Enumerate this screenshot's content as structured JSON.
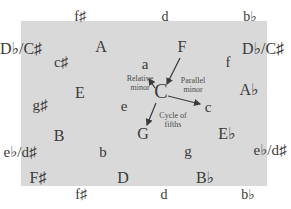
{
  "diagram": {
    "colors": {
      "panel": "#d9d9d9",
      "text": "#3a3a3a",
      "arrow": "#3a3a3a"
    },
    "keys": {
      "top_f_sharp": "f♯",
      "top_d": "d",
      "top_b_flat": "b♭",
      "left_db_cs_top": "D♭/C♯",
      "right_db_cs_top": "D♭/C♯",
      "A": "A",
      "c_sharp": "c♯",
      "a": "a",
      "F": "F",
      "f": "f",
      "C": "C",
      "E": "E",
      "A_flat": "A♭",
      "g_sharp": "g♯",
      "e": "e",
      "c": "c",
      "G": "G",
      "B": "B",
      "E_flat": "E♭",
      "left_eb_ds": "e♭/d♯",
      "right_eb_ds": "e♭/d♯",
      "b": "b",
      "g": "g",
      "F_sharp": "F♯",
      "D": "D",
      "B_flat": "B♭",
      "bottom_f_sharp": "f♯",
      "bottom_d": "d",
      "bottom_b_flat": "b♭"
    },
    "labels": {
      "relative_minor": "Relative\nminor",
      "parallel_minor": "Parallel\nminor",
      "cycle_of_fifths": "Cycle of\nfifths"
    }
  }
}
